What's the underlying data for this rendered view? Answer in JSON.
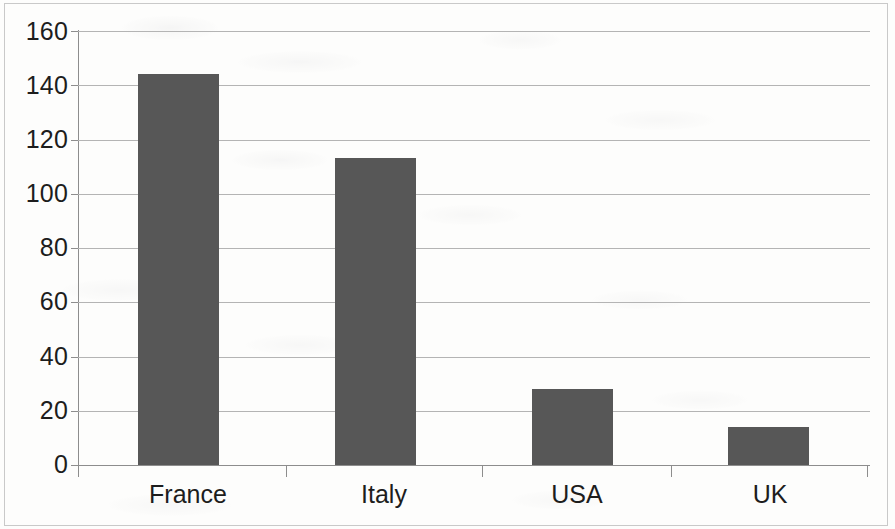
{
  "chart_data": {
    "type": "bar",
    "title": "",
    "subtitle": "",
    "xlabel": "",
    "ylabel": "",
    "categories": [
      "France",
      "Italy",
      "USA",
      "UK"
    ],
    "values": [
      144,
      113,
      28,
      14
    ],
    "series": [
      {
        "name": "",
        "values": [
          144,
          113,
          28,
          14
        ]
      }
    ],
    "ylim": [
      0,
      160
    ],
    "y_ticks": [
      0,
      20,
      40,
      60,
      80,
      100,
      120,
      140,
      160
    ],
    "y_tick_labels": [
      "0",
      "20",
      "40",
      "60",
      "80",
      "100",
      "120",
      "140",
      "160"
    ],
    "grid": "horizontal",
    "legend": "none",
    "bar_color": "#575757",
    "gridline_color": "#b4b4b4",
    "axis_color": "#8d8d8d",
    "background_color": "#fdfdfc",
    "text_color": "#1d1d1d",
    "annotations": []
  }
}
